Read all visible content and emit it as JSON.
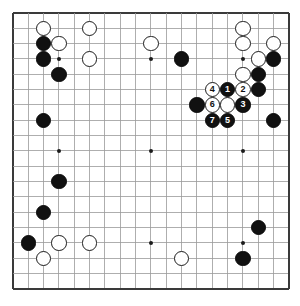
{
  "app": {
    "title": "Go Board Diagram",
    "board_size": 19,
    "description": "19x19 Go board position with numbered move sequence 1-7 in the upper right"
  },
  "colors": {
    "background": "#ffffff",
    "board": "#ffffff",
    "grid_line": "#9a9a9a",
    "grid_border": "#3a3a3a",
    "black_stone": "#111111",
    "white_stone": "#ffffff",
    "stone_outline": "#1b1b1b",
    "black_label": "#ffffff",
    "white_label": "#111111"
  },
  "geometry": {
    "origin_x": 4,
    "origin_y": 4,
    "spacing": 15.33,
    "lines": 19,
    "stone_diameter": 15.5,
    "border_width": 2
  },
  "hoshi_points": [
    {
      "col": 3,
      "row": 3
    },
    {
      "col": 9,
      "row": 3
    },
    {
      "col": 15,
      "row": 3
    },
    {
      "col": 3,
      "row": 9
    },
    {
      "col": 9,
      "row": 9
    },
    {
      "col": 15,
      "row": 9
    },
    {
      "col": 3,
      "row": 15
    },
    {
      "col": 9,
      "row": 15
    },
    {
      "col": 15,
      "row": 15
    }
  ],
  "stones": [
    {
      "col": 2,
      "row": 1,
      "color": "white",
      "label": ""
    },
    {
      "col": 5,
      "row": 1,
      "color": "white",
      "label": ""
    },
    {
      "col": 15,
      "row": 1,
      "color": "white",
      "label": ""
    },
    {
      "col": 2,
      "row": 2,
      "color": "black",
      "label": ""
    },
    {
      "col": 3,
      "row": 2,
      "color": "white",
      "label": ""
    },
    {
      "col": 9,
      "row": 2,
      "color": "white",
      "label": ""
    },
    {
      "col": 15,
      "row": 2,
      "color": "white",
      "label": ""
    },
    {
      "col": 17,
      "row": 2,
      "color": "white",
      "label": ""
    },
    {
      "col": 2,
      "row": 3,
      "color": "black",
      "label": ""
    },
    {
      "col": 5,
      "row": 3,
      "color": "white",
      "label": ""
    },
    {
      "col": 11,
      "row": 3,
      "color": "black",
      "label": ""
    },
    {
      "col": 16,
      "row": 3,
      "color": "white",
      "label": ""
    },
    {
      "col": 17,
      "row": 3,
      "color": "black",
      "label": ""
    },
    {
      "col": 3,
      "row": 4,
      "color": "black",
      "label": ""
    },
    {
      "col": 15,
      "row": 4,
      "color": "white",
      "label": ""
    },
    {
      "col": 16,
      "row": 4,
      "color": "black",
      "label": ""
    },
    {
      "col": 13,
      "row": 5,
      "color": "white",
      "label": "4"
    },
    {
      "col": 14,
      "row": 5,
      "color": "black",
      "label": "1"
    },
    {
      "col": 15,
      "row": 5,
      "color": "white",
      "label": "2"
    },
    {
      "col": 16,
      "row": 5,
      "color": "black",
      "label": ""
    },
    {
      "col": 12,
      "row": 6,
      "color": "black",
      "label": ""
    },
    {
      "col": 13,
      "row": 6,
      "color": "white",
      "label": "6"
    },
    {
      "col": 14,
      "row": 6,
      "color": "white",
      "label": ""
    },
    {
      "col": 15,
      "row": 6,
      "color": "black",
      "label": "3"
    },
    {
      "col": 13,
      "row": 7,
      "color": "black",
      "label": "7"
    },
    {
      "col": 14,
      "row": 7,
      "color": "black",
      "label": "5"
    },
    {
      "col": 17,
      "row": 7,
      "color": "black",
      "label": ""
    },
    {
      "col": 2,
      "row": 7,
      "color": "black",
      "label": ""
    },
    {
      "col": 3,
      "row": 11,
      "color": "black",
      "label": ""
    },
    {
      "col": 2,
      "row": 13,
      "color": "black",
      "label": ""
    },
    {
      "col": 1,
      "row": 15,
      "color": "black",
      "label": ""
    },
    {
      "col": 3,
      "row": 15,
      "color": "white",
      "label": ""
    },
    {
      "col": 5,
      "row": 15,
      "color": "white",
      "label": ""
    },
    {
      "col": 2,
      "row": 16,
      "color": "white",
      "label": ""
    },
    {
      "col": 11,
      "row": 16,
      "color": "white",
      "label": ""
    },
    {
      "col": 15,
      "row": 16,
      "color": "black",
      "label": ""
    },
    {
      "col": 16,
      "row": 14,
      "color": "black",
      "label": ""
    }
  ],
  "move_sequence": [
    {
      "number": "1",
      "color": "black"
    },
    {
      "number": "2",
      "color": "white"
    },
    {
      "number": "3",
      "color": "black"
    },
    {
      "number": "4",
      "color": "white"
    },
    {
      "number": "5",
      "color": "black"
    },
    {
      "number": "6",
      "color": "white"
    },
    {
      "number": "7",
      "color": "black"
    }
  ]
}
